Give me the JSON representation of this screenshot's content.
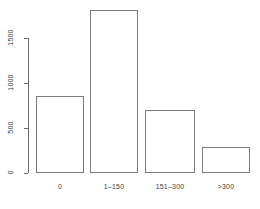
{
  "chart_data": {
    "type": "bar",
    "title": "",
    "subtitle": "",
    "xlabel": "",
    "ylabel": "",
    "categories": [
      "0",
      "1–150",
      "151–300",
      ">300"
    ],
    "values": [
      860,
      1810,
      700,
      290
    ],
    "series": [
      {
        "name": "count",
        "values": [
          860,
          1810,
          700,
          290
        ]
      }
    ],
    "ylim": [
      0,
      1810
    ],
    "y_ticks": [
      0,
      500,
      1000,
      1500
    ],
    "y_tick_labels": [
      "0",
      "500",
      "1000",
      "1500"
    ],
    "grid": false,
    "legend": false,
    "legend_position": "none",
    "bar_fill_color": "#ffffff",
    "bar_border_color": "#7a7a7a",
    "axis_color": "#6e6e6e",
    "text_color": "#3d3d3d",
    "background_color": "#ffffff",
    "y_tick_label_rotation": -90,
    "annotations": []
  }
}
